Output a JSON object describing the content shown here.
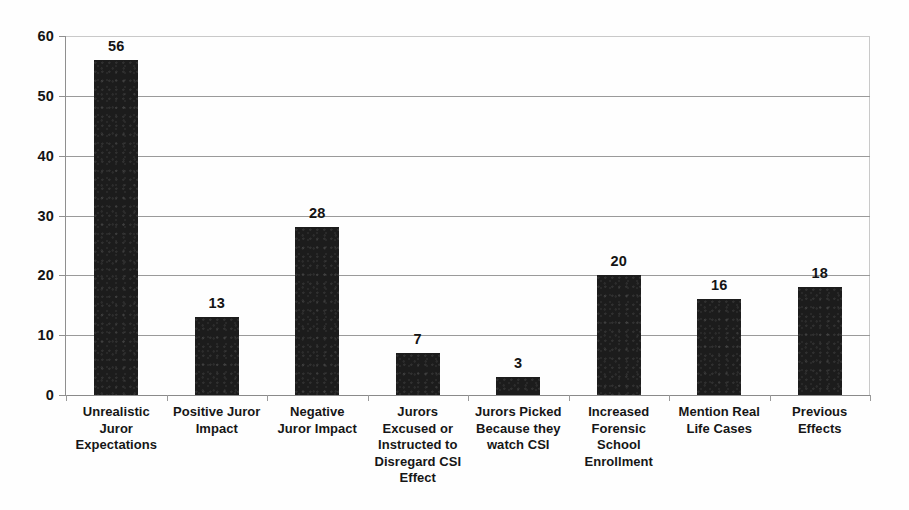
{
  "chart_data": {
    "type": "bar",
    "title": "",
    "subtitle": "",
    "xlabel": "",
    "ylabel": "",
    "ylim": [
      0,
      60
    ],
    "y_ticks": [
      0,
      10,
      20,
      30,
      40,
      50,
      60
    ],
    "grid": true,
    "legend": "none",
    "orientation": "vertical",
    "bar_color": "#1c1c1c",
    "gridline_color": "#9a9a9a",
    "data_labels": true,
    "categories": [
      "Unrealistic Juror Expectations",
      "Positive Juror Impact",
      "Negative Juror Impact",
      "Jurors Excused or Instructed to Disregard CSI Effect",
      "Jurors Picked Because they watch CSI",
      "Increased Forensic School Enrollment",
      "Mention Real Life Cases",
      "Previous Effects"
    ],
    "category_lines": [
      [
        "Unrealistic",
        "Juror",
        "Expectations"
      ],
      [
        "Positive Juror",
        "Impact"
      ],
      [
        "Negative",
        "Juror Impact"
      ],
      [
        "Jurors",
        "Excused or",
        "Instructed to",
        "Disregard CSI",
        "Effect"
      ],
      [
        "Jurors Picked",
        "Because they",
        "watch CSI"
      ],
      [
        "Increased",
        "Forensic",
        "School",
        "Enrollment"
      ],
      [
        "Mention Real",
        "Life Cases"
      ],
      [
        "Previous",
        "Effects"
      ]
    ],
    "values": [
      56,
      13,
      28,
      7,
      3,
      20,
      16,
      18
    ],
    "value_labels": [
      "56",
      "13",
      "28",
      "7",
      "3",
      "20",
      "16",
      "18"
    ],
    "y_tick_labels": [
      "0",
      "10",
      "20",
      "30",
      "40",
      "50",
      "60"
    ]
  }
}
